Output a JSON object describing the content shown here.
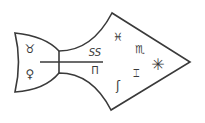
{
  "diagram": {
    "type": "symbolic-sigil",
    "shape": "fish-arrow",
    "stroke_color": "#3a3a3a",
    "background_color": "#ffffff",
    "symbols": {
      "tail_top": "♉",
      "tail_bottom": "♀",
      "neck_top": "SS",
      "neck_bottom": "Π",
      "head_upper_left": "♓",
      "head_upper_right": "♏",
      "head_star": "✳",
      "head_middle": "⌶",
      "head_lower": "ʃ"
    }
  }
}
